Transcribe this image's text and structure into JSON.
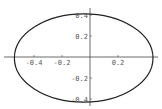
{
  "chart_data": {
    "type": "line",
    "title": "",
    "xlabel": "",
    "ylabel": "",
    "xlim": [
      -0.54,
      0.5
    ],
    "ylim": [
      -0.44,
      0.44
    ],
    "grid": false,
    "legend": null,
    "x_ticks": [
      {
        "value": -0.4,
        "label": "-0.4"
      },
      {
        "value": -0.2,
        "label": "-0.2"
      },
      {
        "value": 0.2,
        "label": "0.2"
      }
    ],
    "y_ticks": [
      {
        "value": 0.4,
        "label": "0.4"
      },
      {
        "value": 0.2,
        "label": "0.2"
      },
      {
        "value": -0.2,
        "label": "-0.2"
      },
      {
        "value": -0.4,
        "label": "-0.4"
      }
    ],
    "series": [
      {
        "name": "ellipse",
        "shape": "ellipse",
        "center": [
          -0.045,
          -0.01
        ],
        "semi_axis_x": 0.495,
        "semi_axis_y": 0.42,
        "color": "#222222"
      }
    ]
  },
  "style": {
    "axis_color": "#444444",
    "curve_color": "#222222",
    "label_color": "#555555",
    "background": "#ffffff"
  },
  "layout": {
    "origin_px": [
      90,
      57
    ],
    "x_px_per_unit": 140,
    "y_px_per_unit": 105
  }
}
